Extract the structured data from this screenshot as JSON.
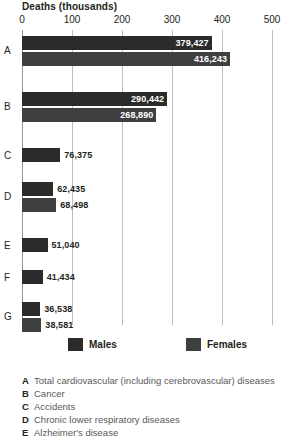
{
  "chart_data": {
    "type": "bar",
    "orientation": "horizontal",
    "title": "Deaths (thousands)",
    "xlabel": "Deaths (thousands)",
    "ylabel": "",
    "xlim": [
      0,
      500
    ],
    "xticks": [
      0,
      100,
      200,
      300,
      400,
      500
    ],
    "xtick_labels": [
      "0",
      "100",
      "200",
      "300",
      "400",
      "500"
    ],
    "grid": true,
    "legend_position": "bottom",
    "categories": [
      "A",
      "B",
      "C",
      "D",
      "E",
      "F",
      "G"
    ],
    "series": [
      {
        "name": "Males",
        "color": "#2b2b2b",
        "values": [
          379427,
          290442,
          76375,
          62435,
          51040,
          41434,
          36538
        ],
        "value_labels": [
          "379,427",
          "290,442",
          "76,375",
          "62,435",
          "51,040",
          "41,434",
          "36,538"
        ]
      },
      {
        "name": "Females",
        "color": "#3f3f3f",
        "values": [
          416243,
          268890,
          null,
          68498,
          null,
          null,
          38581
        ],
        "value_labels": [
          "416,243",
          "268,890",
          "",
          "68,498",
          "",
          "",
          "38,581"
        ]
      }
    ]
  },
  "axis": {
    "title": "Deaths (thousands)",
    "ticks": [
      {
        "value": 0,
        "label": "0"
      },
      {
        "value": 100,
        "label": "100"
      },
      {
        "value": 200,
        "label": "200"
      },
      {
        "value": 300,
        "label": "300"
      },
      {
        "value": 400,
        "label": "400"
      },
      {
        "value": 500,
        "label": "500"
      }
    ]
  },
  "rows": [
    {
      "letter": "A",
      "bars": [
        {
          "series": "Males",
          "value": 379427,
          "label": "379,427"
        },
        {
          "series": "Females",
          "value": 416243,
          "label": "416,243"
        }
      ]
    },
    {
      "letter": "B",
      "bars": [
        {
          "series": "Males",
          "value": 290442,
          "label": "290,442"
        },
        {
          "series": "Females",
          "value": 268890,
          "label": "268,890"
        }
      ]
    },
    {
      "letter": "C",
      "bars": [
        {
          "series": "Males",
          "value": 76375,
          "label": "76,375"
        }
      ]
    },
    {
      "letter": "D",
      "bars": [
        {
          "series": "Males",
          "value": 62435,
          "label": "62,435"
        },
        {
          "series": "Females",
          "value": 68498,
          "label": "68,498"
        }
      ]
    },
    {
      "letter": "E",
      "bars": [
        {
          "series": "Males",
          "value": 51040,
          "label": "51,040"
        }
      ]
    },
    {
      "letter": "F",
      "bars": [
        {
          "series": "Males",
          "value": 41434,
          "label": "41,434"
        }
      ]
    },
    {
      "letter": "G",
      "bars": [
        {
          "series": "Males",
          "value": 36538,
          "label": "36,538"
        },
        {
          "series": "Females",
          "value": 38581,
          "label": "38,581"
        }
      ]
    }
  ],
  "legend": {
    "items": [
      {
        "label": "Males",
        "color": "#2b2b2b"
      },
      {
        "label": "Females",
        "color": "#3f3f3f"
      }
    ]
  },
  "key": [
    {
      "letter": "A",
      "text": "Total cardiovascular (including cerebrovascular) diseases"
    },
    {
      "letter": "B",
      "text": "Cancer"
    },
    {
      "letter": "C",
      "text": "Accidents"
    },
    {
      "letter": "D",
      "text": "Chronic lower respiratory diseases"
    },
    {
      "letter": "E",
      "text": "Alzheimer's disease"
    }
  ]
}
